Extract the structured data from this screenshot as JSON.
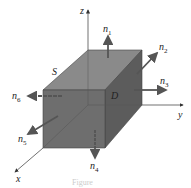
{
  "figure": {
    "axes": {
      "x": "x",
      "y": "y",
      "z": "z"
    },
    "region_label": "D",
    "surface_label": "S",
    "normals": [
      {
        "name": "n",
        "sub": "1"
      },
      {
        "name": "n",
        "sub": "2"
      },
      {
        "name": "n",
        "sub": "3"
      },
      {
        "name": "n",
        "sub": "4"
      },
      {
        "name": "n",
        "sub": "5"
      },
      {
        "name": "n",
        "sub": "6"
      }
    ],
    "caption": "Figure",
    "colors": {
      "box_front": "#6e6e6e",
      "box_top": "#8a8a8a",
      "box_side": "#5a5a5a",
      "arrow": "#555555",
      "axis": "#333333"
    }
  }
}
